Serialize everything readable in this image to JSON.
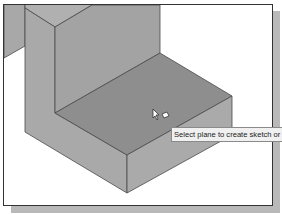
{
  "viewport": {
    "model": "L-bracket-solid",
    "colors": {
      "back_wall": "#a3a3a3",
      "top_face_selected": "#8e8e8e",
      "left_face": "#a9a9a9",
      "front_face": "#a1a1a1",
      "right_face": "#aaaaaa",
      "wall_top": "#b0b0b0",
      "edge": "#4a4a4a"
    }
  },
  "cursor": {
    "type": "select-plane-cursor"
  },
  "tooltip": {
    "text": "Select plane to create sketch or"
  }
}
